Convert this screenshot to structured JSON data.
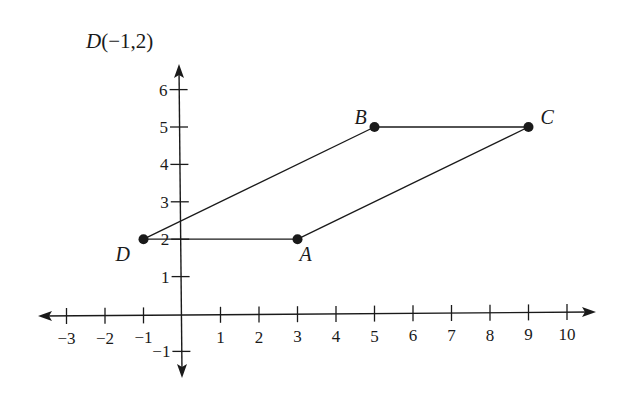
{
  "title": {
    "point": "D",
    "coords": "(−1,2)"
  },
  "axes": {
    "x_ticks": [
      "−3",
      "−2",
      "−1",
      "1",
      "2",
      "3",
      "4",
      "5",
      "6",
      "7",
      "8",
      "9",
      "10"
    ],
    "y_ticks": [
      "−1",
      "1",
      "2",
      "3",
      "4",
      "5",
      "6"
    ],
    "x_tick_values": [
      -3,
      -2,
      -1,
      1,
      2,
      3,
      4,
      5,
      6,
      7,
      8,
      9,
      10
    ],
    "y_tick_values": [
      -1,
      1,
      2,
      3,
      4,
      5,
      6
    ]
  },
  "points": [
    {
      "label": "A",
      "x": 3,
      "y": 2
    },
    {
      "label": "B",
      "x": 5,
      "y": 5
    },
    {
      "label": "C",
      "x": 9,
      "y": 5
    },
    {
      "label": "D",
      "x": -1,
      "y": 2
    }
  ],
  "segments": [
    [
      "D",
      "A"
    ],
    [
      "A",
      "C"
    ],
    [
      "C",
      "B"
    ],
    [
      "B",
      "D"
    ]
  ],
  "colors": {
    "ink": "#1a1a1a",
    "background": "#ffffff"
  }
}
